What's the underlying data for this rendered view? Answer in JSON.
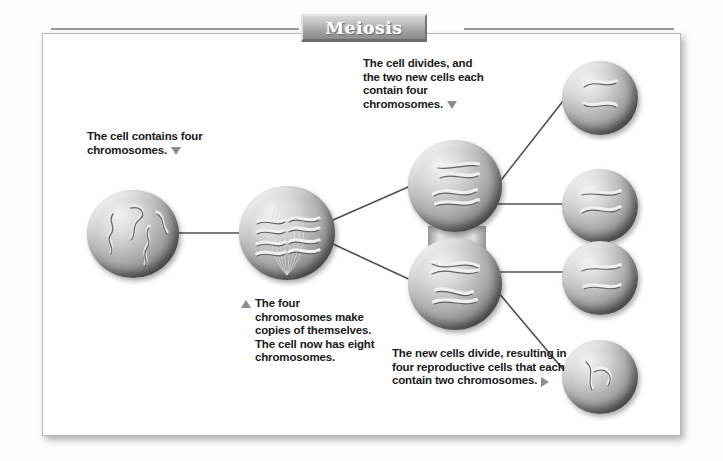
{
  "title": "Meiosis",
  "labels": {
    "stage1": "The cell contains four chromosomes.",
    "stage2": "The four chromosomes make copies of themselves. The cell now has eight chromosomes.",
    "stage3": "The cell divides, and the two new cells each contain four chromosomes.",
    "stage4": "The new cells divide, resulting in four reproductive cells that each contain two chromosomes."
  },
  "cells": [
    {
      "name": "parent-cell",
      "chromosomes": 4
    },
    {
      "name": "duplicated-cell",
      "chromosomes": 8
    },
    {
      "name": "daughter-cell-upper",
      "chromosomes": 4
    },
    {
      "name": "daughter-cell-lower",
      "chromosomes": 4
    },
    {
      "name": "reproductive-cell-1",
      "chromosomes": 2
    },
    {
      "name": "reproductive-cell-2",
      "chromosomes": 2
    },
    {
      "name": "reproductive-cell-3",
      "chromosomes": 2
    },
    {
      "name": "reproductive-cell-4",
      "chromosomes": 2
    }
  ],
  "colors": {
    "cell_light": "#f3f3f3",
    "cell_mid": "#a8a8a8",
    "cell_dark": "#4a4a4a",
    "banner": "#9d9d9d",
    "line": "#4f4f4f",
    "text": "#1a1a1a",
    "triangle": "#8d8d8d"
  }
}
